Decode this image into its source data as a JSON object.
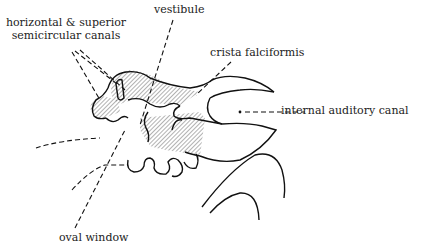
{
  "diagram": {
    "type": "anatomical-line-drawing",
    "colors": {
      "line": "#111111",
      "hatch": "#555555",
      "text": "#222222",
      "background": "#ffffff"
    },
    "labels": {
      "semicircular_line1": "horizontal & superior",
      "semicircular_line2": "semicircular canals",
      "vestibule": "vestibule",
      "crista": "crista falciformis",
      "iac": "internal auditory canal",
      "oval": "oval window"
    }
  }
}
